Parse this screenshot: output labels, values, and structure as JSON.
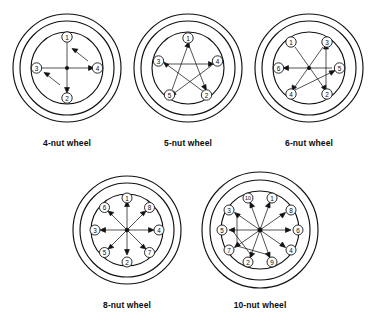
{
  "figure": {
    "title": "",
    "background_color": "#ffffff",
    "line_color": "#111111",
    "text_color": "#0b0b0b"
  },
  "wheels": [
    {
      "id": "wheel-4",
      "caption": "4-nut wheel",
      "nut_count": 4,
      "nuts": [
        {
          "label": "1",
          "order": 1,
          "angle_deg": 270,
          "position": "top"
        },
        {
          "label": "2",
          "order": 2,
          "angle_deg": 90,
          "position": "bottom"
        },
        {
          "label": "3",
          "order": 3,
          "angle_deg": 180,
          "position": "left"
        },
        {
          "label": "4",
          "order": 4,
          "angle_deg": 0,
          "position": "right"
        }
      ],
      "sequence": [
        "1",
        "2",
        "3",
        "4"
      ],
      "pattern": "cross"
    },
    {
      "id": "wheel-5",
      "caption": "5-nut wheel",
      "nut_count": 5,
      "nuts": [
        {
          "label": "1",
          "order": 1,
          "angle_deg": 270,
          "position": "top"
        },
        {
          "label": "2",
          "order": 2,
          "angle_deg": 54,
          "position": "lower-right"
        },
        {
          "label": "3",
          "order": 3,
          "angle_deg": 198,
          "position": "upper-left"
        },
        {
          "label": "4",
          "order": 4,
          "angle_deg": 342,
          "position": "upper-right"
        },
        {
          "label": "5",
          "order": 5,
          "angle_deg": 126,
          "position": "lower-left"
        }
      ],
      "sequence": [
        "1",
        "2",
        "3",
        "4",
        "5"
      ],
      "pattern": "star"
    },
    {
      "id": "wheel-6",
      "caption": "6-nut wheel",
      "nut_count": 6,
      "nuts": [
        {
          "label": "1",
          "order": 1,
          "angle_deg": 240,
          "position": "upper-left"
        },
        {
          "label": "2",
          "order": 2,
          "angle_deg": 60,
          "position": "lower-right"
        },
        {
          "label": "3",
          "order": 3,
          "angle_deg": 300,
          "position": "upper-right"
        },
        {
          "label": "4",
          "order": 4,
          "angle_deg": 120,
          "position": "lower-left"
        },
        {
          "label": "5",
          "order": 5,
          "angle_deg": 0,
          "position": "right"
        },
        {
          "label": "6",
          "order": 6,
          "angle_deg": 180,
          "position": "left"
        }
      ],
      "sequence": [
        "1",
        "2",
        "3",
        "4",
        "5",
        "6"
      ],
      "pattern": "star"
    },
    {
      "id": "wheel-8",
      "caption": "8-nut wheel",
      "nut_count": 8,
      "nuts": [
        {
          "label": "1",
          "order": 1,
          "angle_deg": 270,
          "position": "top"
        },
        {
          "label": "2",
          "order": 2,
          "angle_deg": 90,
          "position": "bottom"
        },
        {
          "label": "3",
          "order": 3,
          "angle_deg": 180,
          "position": "left"
        },
        {
          "label": "4",
          "order": 4,
          "angle_deg": 0,
          "position": "right"
        },
        {
          "label": "5",
          "order": 5,
          "angle_deg": 135,
          "position": "lower-left"
        },
        {
          "label": "6",
          "order": 6,
          "angle_deg": 225,
          "position": "upper-left"
        },
        {
          "label": "7",
          "order": 7,
          "angle_deg": 45,
          "position": "lower-right"
        },
        {
          "label": "8",
          "order": 8,
          "angle_deg": 315,
          "position": "upper-right"
        }
      ],
      "sequence": [
        "1",
        "2",
        "3",
        "4",
        "5",
        "6",
        "7",
        "8"
      ],
      "pattern": "star"
    },
    {
      "id": "wheel-10",
      "caption": "10-nut wheel",
      "nut_count": 10,
      "nuts": [
        {
          "label": "1",
          "order": 1,
          "angle_deg": 288,
          "position": "top-right"
        },
        {
          "label": "2",
          "order": 2,
          "angle_deg": 108,
          "position": "bottom-left"
        },
        {
          "label": "3",
          "order": 3,
          "angle_deg": 216,
          "position": "upper-left"
        },
        {
          "label": "4",
          "order": 4,
          "angle_deg": 36,
          "position": "lower-right"
        },
        {
          "label": "5",
          "order": 5,
          "angle_deg": 180,
          "position": "left"
        },
        {
          "label": "6",
          "order": 6,
          "angle_deg": 0,
          "position": "right"
        },
        {
          "label": "7",
          "order": 7,
          "angle_deg": 144,
          "position": "lower-left"
        },
        {
          "label": "8",
          "order": 8,
          "angle_deg": 324,
          "position": "upper-right"
        },
        {
          "label": "9",
          "order": 9,
          "angle_deg": 72,
          "position": "bottom-right"
        },
        {
          "label": "10",
          "order": 10,
          "angle_deg": 252,
          "position": "top-left"
        }
      ],
      "sequence": [
        "1",
        "2",
        "3",
        "4",
        "5",
        "6",
        "7",
        "8",
        "9",
        "10"
      ],
      "pattern": "star"
    }
  ]
}
